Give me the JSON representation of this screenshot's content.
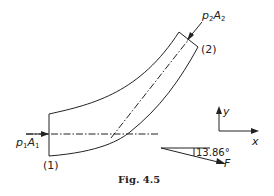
{
  "figure": {
    "caption": "Fig. 4.5",
    "section_labels": {
      "inlet": "(1)",
      "outlet": "(2)"
    },
    "forces": {
      "inlet": {
        "symbol_p": "p",
        "sub_p": "1",
        "symbol_A": "A",
        "sub_A": "1"
      },
      "outlet": {
        "symbol_p": "p",
        "sub_p": "2",
        "symbol_A": "A",
        "sub_A": "2"
      },
      "resultant": {
        "symbol": "F",
        "angle": "13.86°"
      }
    },
    "axes": {
      "x": "x",
      "y": "y"
    },
    "colors": {
      "line": "#222222",
      "background": "#ffffff"
    }
  }
}
